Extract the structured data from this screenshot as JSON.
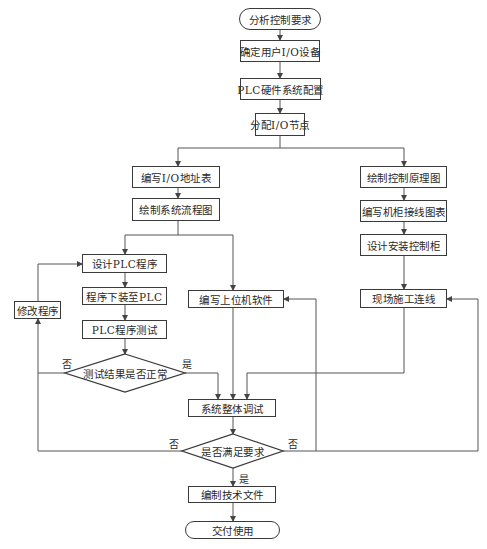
{
  "diagram": {
    "type": "flowchart",
    "nodes": {
      "start": "分析控制要求",
      "determine_io": "确定用户I/O设备",
      "hw_config": "PLC硬件系统配置",
      "assign_io": "分配I/O节点",
      "io_table": "编写I/O地址表",
      "flow_chart": "绘制系统流程图",
      "control_schematic": "绘制控制原理图",
      "cabinet_wiring": "编写机柜接线图表",
      "cabinet_design": "设计安装控制柜",
      "design_plc": "设计PLC程序",
      "download_plc": "程序下装至PLC",
      "test_plc": "PLC程序测试",
      "modify_program": "修改程序",
      "test_ok": "测试结果是否正常",
      "host_software": "编写上位机软件",
      "field_wiring": "现场施工连线",
      "system_debug": "系统整体调试",
      "meets_req": "是否满足要求",
      "tech_docs": "编制技术文件",
      "end": "交付使用"
    },
    "edge_labels": {
      "test_no": "否",
      "test_yes": "是",
      "req_no_left": "否",
      "req_no_right": "否",
      "req_yes": "是"
    }
  }
}
